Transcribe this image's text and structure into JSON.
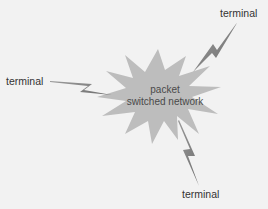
{
  "diagram": {
    "center_node": {
      "line1": "packet",
      "line2": "switched network",
      "shape": "starburst",
      "fill": "#b7b7b7"
    },
    "terminals": [
      {
        "label": "terminal",
        "position": "left"
      },
      {
        "label": "terminal",
        "position": "top-right"
      },
      {
        "label": "terminal",
        "position": "bottom"
      }
    ],
    "link_style": "lightning-bolt",
    "link_color": "#7a7a7a",
    "background": "#f2f2f2"
  }
}
